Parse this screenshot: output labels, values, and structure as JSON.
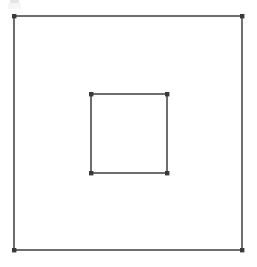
{
  "figure": {
    "background_color": "#ffffff",
    "width": 257,
    "height": 267,
    "line_color": "#4a4a4a",
    "vertex_color": "#3a3a3a",
    "line_width": 1.6,
    "vertex_size": 4
  },
  "chart_data": {
    "type": "scatter",
    "subtitle": "",
    "xlabel": "",
    "ylabel": "",
    "xlim": [
      0,
      257
    ],
    "ylim": [
      0,
      267
    ],
    "grid": false,
    "legend_position": "none",
    "annotations": [],
    "series": [
      {
        "name": "outer-square",
        "shape": "square",
        "closed": true,
        "stroke": "#4a4a4a",
        "fill": "none",
        "x": [
          14,
          242,
          242,
          14
        ],
        "y": [
          16,
          16,
          250,
          250
        ],
        "width": 228,
        "height": 234,
        "vertices": [
          {
            "label": "outer-top-left",
            "x": 14,
            "y": 16
          },
          {
            "label": "outer-top-right",
            "x": 242,
            "y": 16
          },
          {
            "label": "outer-bottom-right",
            "x": 242,
            "y": 250
          },
          {
            "label": "outer-bottom-left",
            "x": 14,
            "y": 250
          }
        ]
      },
      {
        "name": "inner-square",
        "shape": "square",
        "closed": true,
        "stroke": "#4a4a4a",
        "fill": "none",
        "x": [
          91,
          167,
          167,
          91
        ],
        "y": [
          94,
          94,
          173,
          173
        ],
        "width": 76,
        "height": 79,
        "vertices": [
          {
            "label": "inner-top-left",
            "x": 91,
            "y": 94
          },
          {
            "label": "inner-top-right",
            "x": 167,
            "y": 94
          },
          {
            "label": "inner-bottom-right",
            "x": 167,
            "y": 173
          },
          {
            "label": "inner-bottom-left",
            "x": 91,
            "y": 173
          }
        ]
      }
    ],
    "artifacts": [
      {
        "label": "top-left-smudge",
        "x": 10,
        "y": 0,
        "width": 9,
        "height": 4
      },
      {
        "label": "lower-left-smudge",
        "x": 62,
        "y": 214,
        "width": 9,
        "height": 9
      }
    ]
  }
}
